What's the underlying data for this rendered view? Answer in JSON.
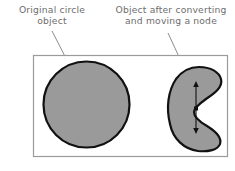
{
  "figure": {
    "background_color": "#ffffff",
    "frame": {
      "border_color": "#9a9a9a",
      "fill_color": "#ffffff",
      "x": 33,
      "y": 55,
      "width": 195,
      "height": 102
    },
    "labels": {
      "left": {
        "text": "Original circle\nobject",
        "color": "#6d6d6d",
        "line1": "Original circle",
        "line2": "object"
      },
      "right": {
        "text": "Object after converting\nand moving a node",
        "color": "#6d6d6d",
        "line1": "Object after converting",
        "line2": "and moving a node"
      }
    },
    "leader_lines": {
      "color": "#8c8c96",
      "left": {
        "x1": 52,
        "y1": 31,
        "x2": 73,
        "y2": 72
      },
      "right": {
        "x1": 168,
        "y1": 33,
        "x2": 186,
        "y2": 72
      }
    },
    "shapes": [
      {
        "name": "circle-object",
        "type": "circle",
        "fill": "#9a9a9a",
        "stroke": "#111111",
        "stroke_width": 2.2,
        "cx": 86.5,
        "cy": 104.5,
        "r": 43.5
      },
      {
        "name": "crescent-object",
        "type": "path",
        "fill": "#9a9a9a",
        "stroke": "#111111",
        "stroke_width": 2.2,
        "bbox": {
          "x": 168,
          "y": 66,
          "width": 54,
          "height": 86
        }
      }
    ],
    "node_handle": {
      "name": "node-handle",
      "color": "#111111",
      "x": 196,
      "y_top": 82,
      "y_bottom": 133,
      "node_y": 108,
      "arrow_ends": 2
    }
  }
}
